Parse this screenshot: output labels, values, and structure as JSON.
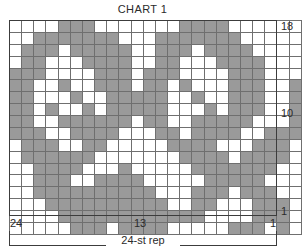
{
  "chart_data": {
    "type": "heatmap",
    "title": "CHART 1",
    "xlabel": "24-st rep",
    "ylabel": "",
    "grid": true,
    "legend_position": "none",
    "columns": 24,
    "rows": 18,
    "x_tick_labels": [
      {
        "text": "24",
        "column": 24
      },
      {
        "text": "13",
        "column": 13
      },
      {
        "text": "1",
        "column": 1
      }
    ],
    "y_tick_labels": [
      {
        "text": "18",
        "row": 18
      },
      {
        "text": "10",
        "row": 10
      },
      {
        "text": "1",
        "row": 1
      }
    ],
    "column_order": "right-to-left",
    "annotations": [
      "24-st rep"
    ],
    "cell_colors": {
      "filled": "#9a9a9a",
      "empty": "#ffffff"
    },
    "cell_values": {
      "filled": 1,
      "empty": 0
    },
    "matrix_note": "Each inner array is one chart row, listed from row 18 (top) down to row 1 (bottom); within a row cells are listed left-to-right, i.e. stitch 24 first down to stitch 1.",
    "matrix": [
      [
        0,
        0,
        0,
        0,
        1,
        1,
        1,
        0,
        0,
        0,
        0,
        0,
        0,
        0,
        1,
        1,
        1,
        1,
        0,
        0,
        0,
        0,
        0,
        0
      ],
      [
        0,
        0,
        1,
        1,
        1,
        1,
        1,
        1,
        1,
        0,
        0,
        0,
        1,
        1,
        1,
        1,
        1,
        1,
        1,
        0,
        0,
        0,
        0,
        0
      ],
      [
        0,
        1,
        1,
        1,
        0,
        1,
        1,
        1,
        1,
        1,
        0,
        0,
        1,
        1,
        1,
        0,
        1,
        1,
        1,
        1,
        0,
        0,
        0,
        0
      ],
      [
        0,
        1,
        1,
        0,
        0,
        0,
        1,
        1,
        1,
        1,
        0,
        0,
        1,
        1,
        0,
        0,
        0,
        1,
        1,
        1,
        1,
        0,
        0,
        0
      ],
      [
        1,
        1,
        1,
        0,
        0,
        0,
        0,
        1,
        1,
        1,
        0,
        1,
        1,
        1,
        0,
        0,
        0,
        0,
        1,
        1,
        1,
        0,
        0,
        0
      ],
      [
        1,
        1,
        0,
        0,
        1,
        0,
        0,
        1,
        1,
        1,
        0,
        1,
        1,
        0,
        1,
        0,
        0,
        0,
        1,
        1,
        1,
        0,
        0,
        1
      ],
      [
        1,
        1,
        0,
        0,
        0,
        1,
        0,
        0,
        1,
        1,
        1,
        1,
        1,
        0,
        0,
        1,
        0,
        0,
        1,
        1,
        1,
        0,
        0,
        1
      ],
      [
        1,
        1,
        0,
        1,
        0,
        0,
        1,
        0,
        1,
        1,
        1,
        1,
        1,
        0,
        0,
        0,
        1,
        0,
        1,
        1,
        1,
        0,
        0,
        1
      ],
      [
        1,
        1,
        0,
        0,
        1,
        1,
        1,
        1,
        1,
        1,
        0,
        1,
        1,
        0,
        0,
        1,
        1,
        1,
        1,
        1,
        0,
        0,
        0,
        1
      ],
      [
        1,
        1,
        1,
        0,
        0,
        1,
        1,
        1,
        1,
        0,
        0,
        0,
        1,
        1,
        0,
        1,
        1,
        1,
        1,
        0,
        0,
        1,
        1,
        1
      ],
      [
        0,
        1,
        1,
        1,
        0,
        0,
        1,
        1,
        0,
        0,
        0,
        0,
        0,
        1,
        1,
        1,
        1,
        0,
        0,
        0,
        1,
        1,
        1,
        0
      ],
      [
        0,
        1,
        1,
        1,
        1,
        1,
        1,
        0,
        0,
        0,
        0,
        0,
        0,
        0,
        1,
        1,
        1,
        1,
        0,
        1,
        1,
        1,
        1,
        0
      ],
      [
        0,
        0,
        1,
        1,
        1,
        1,
        0,
        0,
        0,
        1,
        0,
        0,
        0,
        0,
        0,
        1,
        1,
        1,
        1,
        1,
        1,
        1,
        0,
        0
      ],
      [
        0,
        0,
        1,
        1,
        1,
        0,
        0,
        1,
        1,
        1,
        1,
        0,
        0,
        0,
        0,
        0,
        1,
        1,
        1,
        1,
        1,
        0,
        0,
        0
      ],
      [
        0,
        0,
        1,
        1,
        1,
        1,
        1,
        1,
        1,
        1,
        1,
        1,
        0,
        0,
        0,
        1,
        1,
        1,
        0,
        1,
        1,
        1,
        0,
        0
      ],
      [
        0,
        0,
        0,
        1,
        1,
        1,
        1,
        1,
        1,
        1,
        1,
        1,
        1,
        0,
        0,
        1,
        1,
        0,
        0,
        0,
        1,
        1,
        1,
        0
      ],
      [
        0,
        0,
        0,
        0,
        1,
        1,
        1,
        1,
        1,
        1,
        1,
        1,
        1,
        1,
        1,
        1,
        0,
        0,
        0,
        0,
        1,
        1,
        1,
        0
      ],
      [
        0,
        0,
        0,
        0,
        0,
        1,
        1,
        1,
        0,
        1,
        1,
        1,
        1,
        0,
        0,
        0,
        0,
        0,
        1,
        1,
        1,
        0,
        1,
        0
      ]
    ]
  }
}
